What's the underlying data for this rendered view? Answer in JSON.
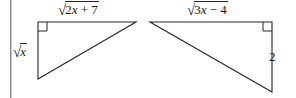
{
  "figure": {
    "name": "two-right-triangles-with-radical-side-labels",
    "width": 296,
    "height": 98,
    "background_color": "#ffffff",
    "stroke_color": "#262626",
    "text_color": "#1b1b1b"
  },
  "left_triangle": {
    "name": "left-right-triangle",
    "vertices": {
      "right_angle_corner": [
        38,
        22
      ],
      "top_right": [
        136,
        22
      ],
      "bottom_left": [
        38,
        79
      ]
    },
    "right_angle_marker": true,
    "labels": {
      "top_leg": {
        "radical_sign": "√",
        "radicand": "2x + 7",
        "radicand_parts": [
          {
            "text": "2",
            "style": "upright"
          },
          {
            "text": "x",
            "style": "italic"
          },
          {
            "text": " + ",
            "style": "upright"
          },
          {
            "text": "7",
            "style": "upright"
          }
        ],
        "text": "√(2x + 7)"
      },
      "vertical_leg": {
        "radical_sign": "√",
        "radicand": "x",
        "radicand_parts": [
          {
            "text": "x",
            "style": "italic"
          }
        ],
        "text": "√x"
      }
    }
  },
  "right_triangle": {
    "name": "right-right-triangle",
    "vertices": {
      "top_left": [
        150,
        22
      ],
      "right_angle_corner": [
        272,
        22
      ],
      "bottom_right": [
        272,
        92
      ]
    },
    "right_angle_marker": true,
    "labels": {
      "top_leg": {
        "radical_sign": "√",
        "radicand": "3x − 4",
        "radicand_parts": [
          {
            "text": "3",
            "style": "upright"
          },
          {
            "text": "x",
            "style": "italic"
          },
          {
            "text": " − ",
            "style": "upright"
          },
          {
            "text": "4",
            "style": "upright"
          }
        ],
        "text": "√(3x − 4)"
      },
      "vertical_leg": {
        "text": "2"
      }
    }
  },
  "artifacts": {
    "left_page_edge_line": {
      "name": "scan-edge-line",
      "x": 10,
      "color": "#8c8c8c"
    }
  }
}
